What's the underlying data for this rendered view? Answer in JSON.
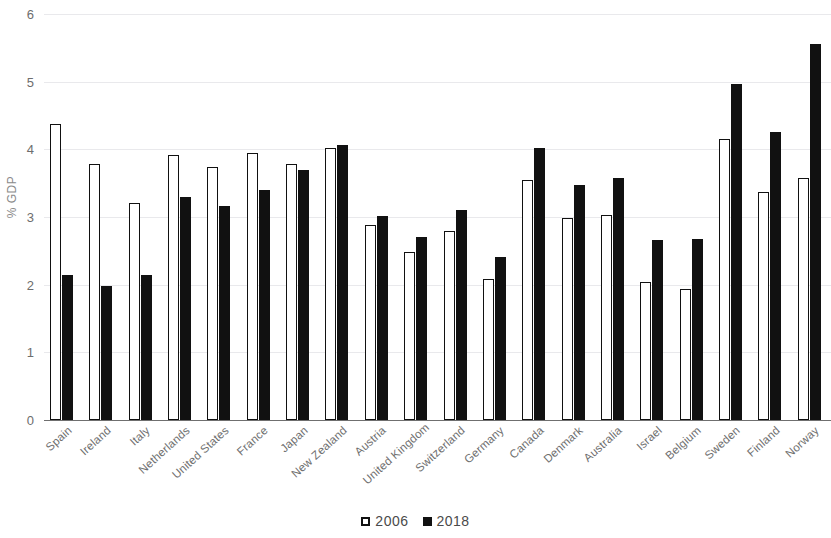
{
  "chart_data": {
    "type": "bar",
    "title": "",
    "subtitle": "",
    "xlabel": "",
    "ylabel": "% GDP",
    "ylim": [
      0,
      6
    ],
    "yticks": [
      0,
      1,
      2,
      3,
      4,
      5,
      6
    ],
    "ytick_labels": [
      "0",
      "1",
      "2",
      "3",
      "4",
      "5",
      "6"
    ],
    "grid": true,
    "grid_axis": "y",
    "legend_position": "bottom-center",
    "orientation": "vertical",
    "categories": [
      "Spain",
      "Ireland",
      "Italy",
      "Netherlands",
      "United States",
      "France",
      "Japan",
      "New Zealand",
      "Austria",
      "United Kingdom",
      "Switzerland",
      "Germany",
      "Canada",
      "Denmark",
      "Australia",
      "Israel",
      "Belgium",
      "Sweden",
      "Finland",
      "Norway"
    ],
    "series": [
      {
        "name": "2006",
        "color": "#ffffff",
        "edge_color": "#111111",
        "values": [
          4.37,
          3.78,
          3.2,
          3.92,
          3.74,
          3.95,
          3.78,
          4.02,
          2.88,
          2.48,
          2.8,
          2.09,
          3.55,
          2.99,
          3.03,
          2.04,
          1.94,
          4.15,
          3.37,
          3.57
        ]
      },
      {
        "name": "2018",
        "color": "#111111",
        "edge_color": "#111111",
        "values": [
          2.15,
          1.98,
          2.15,
          3.3,
          3.17,
          3.4,
          3.7,
          4.07,
          3.01,
          2.7,
          3.1,
          2.41,
          4.02,
          3.48,
          3.58,
          2.66,
          2.68,
          4.96,
          4.25,
          5.56
        ]
      }
    ]
  },
  "legend": {
    "items": [
      {
        "label": "2006",
        "style": "hollow"
      },
      {
        "label": "2018",
        "style": "solid"
      }
    ]
  }
}
